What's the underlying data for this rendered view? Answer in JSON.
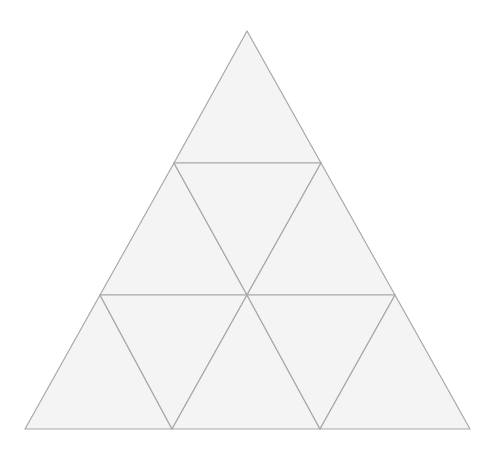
{
  "diagram": {
    "fill": "#f4f4f4",
    "stroke": "#a8a8a8",
    "stroke_width": 1.2,
    "outer_vertices": [
      [
        247,
        31
      ],
      [
        25,
        429
      ],
      [
        470,
        429
      ]
    ],
    "triangles": [
      {
        "id": "t1",
        "orientation": "up",
        "points": [
          [
            247,
            31
          ],
          [
            174,
            163
          ],
          [
            321,
            163
          ]
        ]
      },
      {
        "id": "t2",
        "orientation": "up",
        "points": [
          [
            174,
            163
          ],
          [
            100,
            295
          ],
          [
            247,
            295
          ]
        ]
      },
      {
        "id": "t3",
        "orientation": "down",
        "points": [
          [
            174,
            163
          ],
          [
            321,
            163
          ],
          [
            247,
            295
          ]
        ]
      },
      {
        "id": "t4",
        "orientation": "up",
        "points": [
          [
            321,
            163
          ],
          [
            247,
            295
          ],
          [
            395,
            295
          ]
        ]
      },
      {
        "id": "t5",
        "orientation": "up",
        "points": [
          [
            100,
            295
          ],
          [
            25,
            429
          ],
          [
            172,
            429
          ]
        ]
      },
      {
        "id": "t6",
        "orientation": "down",
        "points": [
          [
            100,
            295
          ],
          [
            247,
            295
          ],
          [
            172,
            429
          ]
        ]
      },
      {
        "id": "t7",
        "orientation": "up",
        "points": [
          [
            247,
            295
          ],
          [
            172,
            429
          ],
          [
            320,
            429
          ]
        ]
      },
      {
        "id": "t8",
        "orientation": "down",
        "points": [
          [
            247,
            295
          ],
          [
            395,
            295
          ],
          [
            320,
            429
          ]
        ]
      },
      {
        "id": "t9",
        "orientation": "up",
        "points": [
          [
            395,
            295
          ],
          [
            320,
            429
          ],
          [
            470,
            429
          ]
        ]
      }
    ]
  }
}
